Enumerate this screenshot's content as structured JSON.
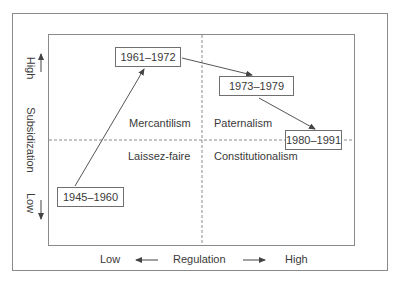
{
  "diagram": {
    "x_axis": {
      "title": "Regulation",
      "low_label": "Low",
      "high_label": "High"
    },
    "y_axis": {
      "title": "Subsidization",
      "low_label": "Low",
      "high_label": "High"
    },
    "quadrants": {
      "top_left": "Mercantilism",
      "top_right": "Paternalism",
      "bottom_left": "Laissez-faire",
      "bottom_right": "Constitutionalism"
    },
    "periods": [
      {
        "label": "1945–1960"
      },
      {
        "label": "1961–1972"
      },
      {
        "label": "1973–1979"
      },
      {
        "label": "1980–1991"
      }
    ],
    "trajectory": [
      "1945–1960",
      "1961–1972",
      "1973–1979",
      "1980–1991"
    ],
    "colors": {
      "line": "#555555",
      "frame": "#8a8a8a",
      "text": "#3a3a3a"
    }
  }
}
